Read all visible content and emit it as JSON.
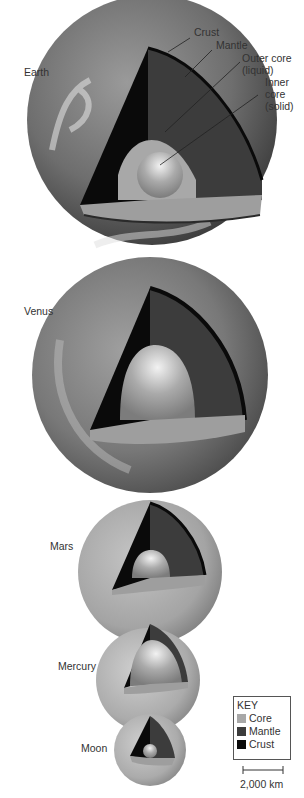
{
  "planets": [
    {
      "name": "Earth"
    },
    {
      "name": "Venus"
    },
    {
      "name": "Mars"
    },
    {
      "name": "Mercury"
    },
    {
      "name": "Moon"
    }
  ],
  "callouts": {
    "crust": "Crust",
    "mantle": "Mantle",
    "outer_core_1": "Outer core",
    "outer_core_2": "(liquid)",
    "inner_core_1": "Inner",
    "inner_core_2": "core",
    "inner_core_3": "(solid)"
  },
  "key": {
    "title": "KEY",
    "items": [
      {
        "label": "Core",
        "color": "#a8a8a8"
      },
      {
        "label": "Mantle",
        "color": "#3c3c3c"
      },
      {
        "label": "Crust",
        "color": "#0a0a0a"
      }
    ]
  },
  "scale_bar": {
    "label": "2,000 km"
  },
  "colors": {
    "crust": "#0a0a0a",
    "mantle": "#3c3c3c",
    "core": "#a8a8a8"
  }
}
